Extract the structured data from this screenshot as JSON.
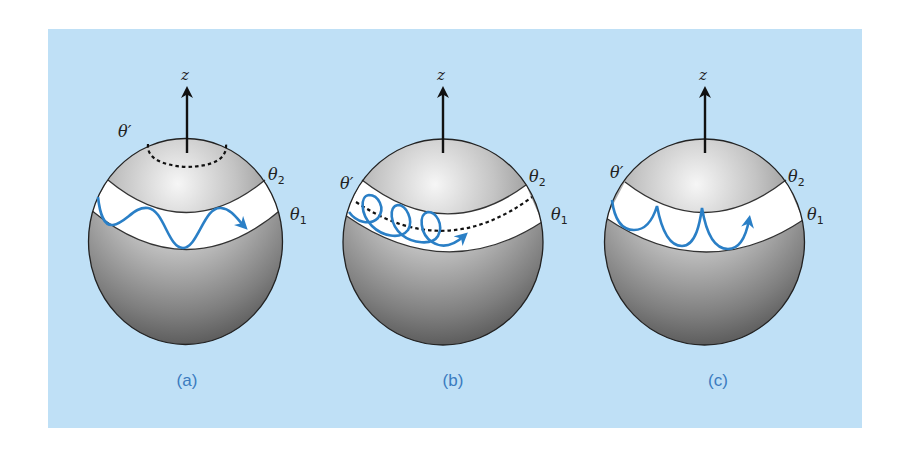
{
  "figure": {
    "background_color": "#bfe0f6",
    "curve_color": "#2a7fc6",
    "caption_color": "#3a7bbf",
    "panels": [
      {
        "id": "a",
        "caption": "(a)",
        "axis_label": "z",
        "labels": {
          "theta_prime": "θ′",
          "theta_2": "θ",
          "theta_2_sub": "2",
          "theta_1": "θ",
          "theta_1_sub": "1"
        },
        "description": "Wavy trajectory confined to band between θ1 and θ2; θ′ circle near pole (dashed)"
      },
      {
        "id": "b",
        "caption": "(b)",
        "axis_label": "z",
        "labels": {
          "theta_prime": "θ′",
          "theta_2": "θ",
          "theta_2_sub": "2",
          "theta_1": "θ",
          "theta_1_sub": "1"
        },
        "description": "Looping trajectory in band; θ′ dashed circle lies inside band"
      },
      {
        "id": "c",
        "caption": "(c)",
        "axis_label": "z",
        "labels": {
          "theta_prime": "θ′",
          "theta_2": "θ",
          "theta_2_sub": "2",
          "theta_1": "θ",
          "theta_1_sub": "1"
        },
        "description": "Cusped trajectory touching θ2 boundary; θ′ coincides with θ2"
      }
    ]
  }
}
